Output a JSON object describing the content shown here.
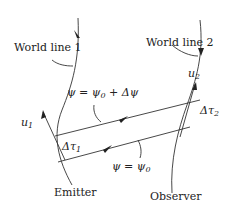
{
  "figure": {
    "labels": {
      "world_line_1": "World line 1",
      "world_line_2": "World line 2",
      "emitter": "Emitter",
      "observer": "Observer",
      "u1": "u",
      "u1_sub": "1",
      "u2": "u",
      "u2_sub": "2",
      "dtau1": "Δτ",
      "dtau1_sub": "1",
      "dtau2": "Δτ",
      "dtau2_sub": "2",
      "psi_upper": "ψ = ψ",
      "psi_upper_sub": "0",
      "psi_upper_tail": " + Δψ",
      "psi_lower": "ψ = ψ",
      "psi_lower_sub": "0"
    },
    "colors": {
      "ink": "#333333",
      "background": "#ffffff"
    }
  }
}
